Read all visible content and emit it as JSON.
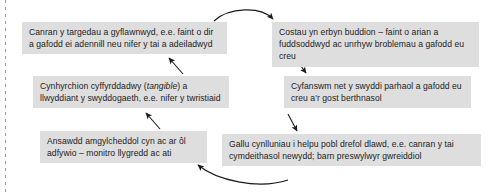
{
  "diagram": {
    "background_color": "#ffffff",
    "node_fill_color": "#dedede",
    "text_color": "#1c1c1c",
    "arrow_color": "#1a1a1a",
    "nodes": [
      {
        "id": "targets",
        "column": "left",
        "text": "Canran y targedau a gyflawnwyd, e.e. faint o dir a gafodd ei adennill neu nifer y tai a adeiladwyd"
      },
      {
        "id": "outputs",
        "column": "left",
        "text_before": "Cynhyrchion cyffyrddadwy (",
        "emphasis": "tangible",
        "text_after": ") a llwyddiant y swyddogaeth, e.e. nifer y twristiaid"
      },
      {
        "id": "quality",
        "column": "left",
        "text": "Ansawdd amgylcheddol cyn ac ar ôl adfywio – monitro llygredd ac ati"
      },
      {
        "id": "costs",
        "column": "right",
        "text": "Costau yn erbyn buddion – faint o arian a fuddsoddwyd ac unrhyw broblemau a gafodd eu creu"
      },
      {
        "id": "jobs",
        "column": "right",
        "text": "Cyfanswm net y swyddi parhaol a gafodd eu creu a'r gost berthnasol"
      },
      {
        "id": "capacity",
        "column": "right",
        "text": "Gallu cynlluniau i helpu pobl drefol dlawd, e.e. canran y tai cymdeithasol newydd; barn preswylwyr gwreiddiol"
      }
    ],
    "connectors": [
      {
        "id": "quality-to-outputs",
        "from": "quality",
        "to": "outputs",
        "style": "straight-arrow",
        "direction": "up"
      },
      {
        "id": "outputs-to-targets",
        "from": "outputs",
        "to": "targets",
        "style": "straight-arrow",
        "direction": "up"
      },
      {
        "id": "targets-to-costs",
        "from": "targets",
        "to": "costs",
        "style": "curved-arrow",
        "direction": "right"
      },
      {
        "id": "costs-to-jobs",
        "from": "costs",
        "to": "jobs",
        "style": "straight-arrow",
        "direction": "down"
      },
      {
        "id": "jobs-to-capacity",
        "from": "jobs",
        "to": "capacity",
        "style": "straight-arrow",
        "direction": "down"
      },
      {
        "id": "capacity-to-quality",
        "from": "capacity",
        "to": "quality",
        "style": "curved-arrow",
        "direction": "left"
      }
    ]
  }
}
